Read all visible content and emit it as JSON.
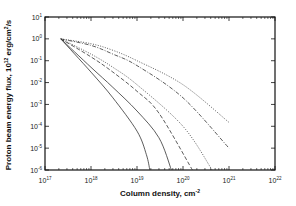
{
  "chart_data": {
    "type": "line",
    "title": "",
    "xlabel": "Column density, cm^-2",
    "ylabel": "Proton beam energy flux, 10^12 erg/cm^2/s",
    "xscale": "log",
    "yscale": "log",
    "xlim": [
      1e+17,
      1e+22
    ],
    "ylim": [
      1e-06,
      10
    ],
    "x_tick_labels": [
      "10^17",
      "10^18",
      "10^19",
      "10^20",
      "10^21",
      "10^22"
    ],
    "y_tick_labels": [
      "10^1",
      "10^0",
      "10^-1",
      "10^-2",
      "10^-3",
      "10^-4",
      "10^-5",
      "10^-6"
    ],
    "grid": false,
    "legend": null,
    "series": [
      {
        "name": "curve-1",
        "style": "solid",
        "x": [
          2.2e+17,
          1e+18,
          3e+18,
          1e+19,
          1.6e+19,
          1.9e+19
        ],
        "y": [
          1,
          0.03,
          0.002,
          6e-05,
          5e-06,
          1e-06
        ]
      },
      {
        "name": "curve-2",
        "style": "solid",
        "x": [
          2.2e+17,
          1e+18,
          3e+18,
          1e+19,
          3e+19,
          5.6e+19
        ],
        "y": [
          1,
          0.05,
          0.006,
          0.0005,
          3e-05,
          1e-06
        ]
      },
      {
        "name": "curve-3",
        "style": "dashed",
        "x": [
          2.2e+17,
          1e+18,
          3e+18,
          1e+19,
          3e+19,
          1.6e+20
        ],
        "y": [
          1,
          0.15,
          0.03,
          0.004,
          0.0004,
          1e-06
        ]
      },
      {
        "name": "curve-4",
        "style": "dotted",
        "x": [
          2.2e+17,
          1e+18,
          3e+18,
          1e+19,
          1e+20,
          4.3e+20
        ],
        "y": [
          1,
          0.2,
          0.05,
          0.008,
          0.0001,
          1e-06
        ]
      },
      {
        "name": "curve-5",
        "style": "dash-dot",
        "x": [
          2.2e+17,
          1e+18,
          3e+18,
          1e+19,
          1e+20,
          1e+21
        ],
        "y": [
          1,
          0.5,
          0.2,
          0.06,
          0.002,
          1e-05
        ]
      },
      {
        "name": "curve-6",
        "style": "dotted",
        "x": [
          2.2e+17,
          1e+18,
          3e+18,
          1e+19,
          1e+20,
          1e+21
        ],
        "y": [
          1,
          0.6,
          0.3,
          0.1,
          0.008,
          0.00015
        ]
      }
    ]
  },
  "labels": {
    "xlabel": "Column density, cm",
    "xlabel_sup": "-2",
    "ylabel_pre": "Proton beam energy flux, 10",
    "ylabel_sup1": "12",
    "ylabel_mid": " erg/cm",
    "ylabel_sup2": "2",
    "ylabel_post": "/s",
    "xticks": [
      {
        "base": "10",
        "exp": "17"
      },
      {
        "base": "10",
        "exp": "18"
      },
      {
        "base": "10",
        "exp": "19"
      },
      {
        "base": "10",
        "exp": "20"
      },
      {
        "base": "10",
        "exp": "21"
      },
      {
        "base": "10",
        "exp": "22"
      }
    ],
    "yticks": [
      {
        "base": "10",
        "exp": "1"
      },
      {
        "base": "10",
        "exp": "0"
      },
      {
        "base": "10",
        "exp": "-1"
      },
      {
        "base": "10",
        "exp": "-2"
      },
      {
        "base": "10",
        "exp": "-3"
      },
      {
        "base": "10",
        "exp": "-4"
      },
      {
        "base": "10",
        "exp": "-5"
      },
      {
        "base": "10",
        "exp": "-6"
      }
    ]
  }
}
